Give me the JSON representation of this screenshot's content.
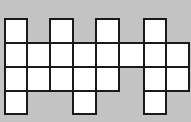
{
  "diagram": {
    "title": "",
    "background_color": "#c3c3c3",
    "cell_fill": "#ffffff",
    "line_color": "#1a1a1a",
    "grid": {
      "columns": 8,
      "rows": 4,
      "col_edges_px": [
        5,
        27,
        50,
        73,
        96,
        119,
        144,
        166,
        189
      ],
      "row_edges_px": [
        19,
        43,
        67,
        91,
        114
      ]
    },
    "cells": [
      {
        "row": 0,
        "col": 0
      },
      {
        "row": 0,
        "col": 2
      },
      {
        "row": 0,
        "col": 4
      },
      {
        "row": 0,
        "col": 6
      },
      {
        "row": 1,
        "col": 0
      },
      {
        "row": 1,
        "col": 1
      },
      {
        "row": 1,
        "col": 2
      },
      {
        "row": 1,
        "col": 3
      },
      {
        "row": 1,
        "col": 4
      },
      {
        "row": 1,
        "col": 5
      },
      {
        "row": 1,
        "col": 6
      },
      {
        "row": 1,
        "col": 7
      },
      {
        "row": 2,
        "col": 0
      },
      {
        "row": 2,
        "col": 1
      },
      {
        "row": 2,
        "col": 2
      },
      {
        "row": 2,
        "col": 3
      },
      {
        "row": 2,
        "col": 4
      },
      {
        "row": 2,
        "col": 6
      },
      {
        "row": 2,
        "col": 7
      },
      {
        "row": 3,
        "col": 0
      },
      {
        "row": 3,
        "col": 3
      },
      {
        "row": 3,
        "col": 6
      }
    ],
    "cell_count": 22
  }
}
